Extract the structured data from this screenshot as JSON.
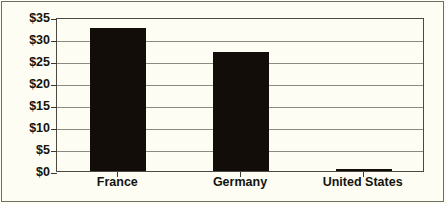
{
  "chart_data": {
    "type": "bar",
    "title": "",
    "subtitle": "",
    "xlabel": "",
    "ylabel": "",
    "categories": [
      "France",
      "Germany",
      "United States"
    ],
    "values": [
      32.5,
      27.0,
      0.4
    ],
    "value_prefix": "$",
    "ylim": [
      0,
      35
    ],
    "ytick_values": [
      0,
      5,
      10,
      15,
      20,
      25,
      30,
      35
    ],
    "ytick_labels": [
      "$0",
      "$5",
      "$10",
      "$15",
      "$20",
      "$25",
      "$30",
      "$35"
    ],
    "grid": true,
    "grid_orientation": "horizontal",
    "legend": false,
    "legend_position": "none",
    "bar_color": "#120d08",
    "grid_color": "#8a8a80",
    "axis_color": "#4a4a42",
    "background_color": "#fdfdf4",
    "text_color": "#14140f",
    "annotations": []
  }
}
